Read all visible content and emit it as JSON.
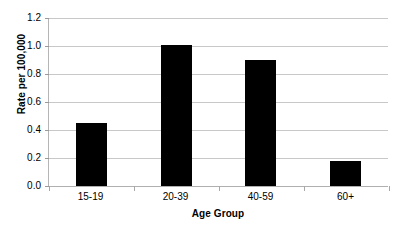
{
  "chart_data": {
    "type": "bar",
    "title": "",
    "xlabel": "Age Group",
    "ylabel": "Rate per 100,000",
    "categories": [
      "15-19",
      "20-39",
      "40-59",
      "60+"
    ],
    "values": [
      0.45,
      1.01,
      0.9,
      0.18
    ],
    "ylim": [
      0.0,
      1.2
    ],
    "ytick_labels": [
      "0.0",
      "0.2",
      "0.4",
      "0.6",
      "0.8",
      "1.0",
      "1.2"
    ],
    "ytick_values": [
      0.0,
      0.2,
      0.4,
      0.6,
      0.8,
      1.0,
      1.2
    ],
    "grid": "horizontal",
    "legend": "none",
    "bar_color": "#000000",
    "grid_color": "#c8c8c8",
    "axis_color": "#b0b0b0",
    "background": "#ffffff"
  }
}
